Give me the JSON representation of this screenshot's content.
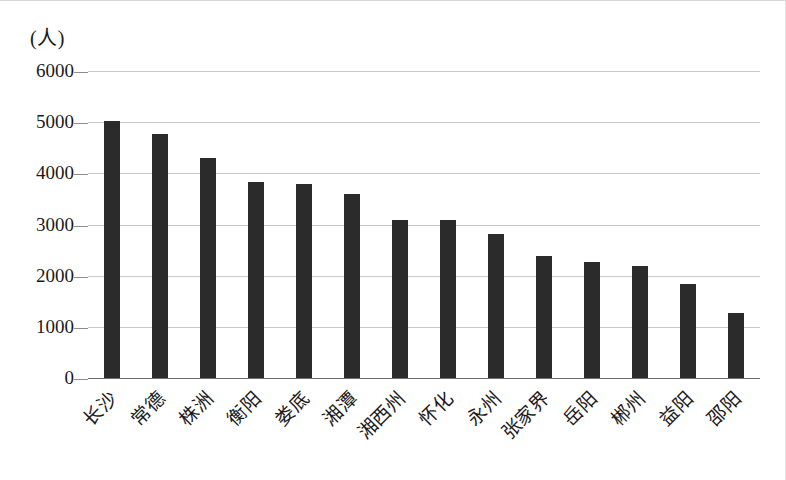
{
  "chart_data": {
    "type": "bar",
    "title": "",
    "subtitle": "",
    "xlabel": "",
    "ylabel": "(人)",
    "unit_caption": "(人)",
    "categories": [
      "长沙",
      "常德",
      "株洲",
      "衡阳",
      "娄底",
      "湘潭",
      "湘西州",
      "怀化",
      "永州",
      "张家界",
      "岳阳",
      "郴州",
      "益阳",
      "邵阳"
    ],
    "values": [
      5030,
      4770,
      4300,
      3840,
      3800,
      3600,
      3080,
      3080,
      2810,
      2390,
      2260,
      2180,
      1830,
      1270
    ],
    "ylim": [
      0,
      6000
    ],
    "ytick_labels": [
      "6000",
      "5000",
      "4000",
      "3000",
      "2000",
      "1000",
      "0"
    ],
    "ytick_values": [
      6000,
      5000,
      4000,
      3000,
      2000,
      1000,
      0
    ],
    "grid": true,
    "grid_axis": "y",
    "legend": false,
    "legend_position": "none",
    "bar_color": "#2b2b2b",
    "gridline_color": "#c9c9c9",
    "axis_color": "#6f6f6f",
    "background_color": "#ffffff",
    "xtick_rotation": -45
  }
}
